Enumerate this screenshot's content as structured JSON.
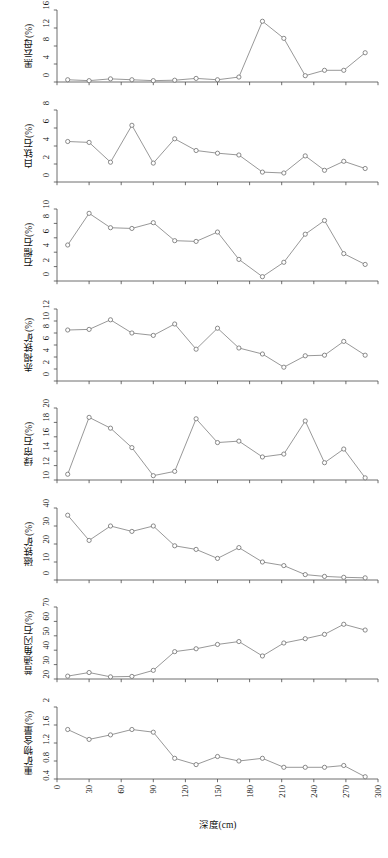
{
  "figure": {
    "xlabel": "深度(cm)",
    "x_ticks": [
      0,
      30,
      60,
      90,
      120,
      150,
      180,
      210,
      240,
      270,
      300
    ],
    "xlim": [
      0,
      300
    ],
    "marker": "open-circle",
    "line_color": "#7d7d7d",
    "marker_color": "#6f6f6f",
    "axis_color": "#4a4a4a",
    "background": "#ffffff"
  },
  "chart_data": [
    {
      "type": "line",
      "title": "",
      "ylabel": "黑云母(%)",
      "xlabel": "深度(cm)",
      "ylim": [
        0,
        16
      ],
      "yticks": [
        0,
        4,
        8,
        12,
        16
      ],
      "xlim": [
        0,
        300
      ],
      "grid": false,
      "legend": "none",
      "x": [
        10,
        30,
        50,
        70,
        90,
        110,
        130,
        150,
        170,
        192,
        212,
        232,
        250,
        268,
        288
      ],
      "values": [
        0.5,
        0.3,
        0.7,
        0.5,
        0.3,
        0.4,
        0.8,
        0.5,
        1.1,
        13.5,
        9.7,
        1.4,
        2.6,
        2.6,
        6.5
      ]
    },
    {
      "type": "line",
      "title": "",
      "ylabel": "白钛石(%)",
      "xlabel": "深度(cm)",
      "ylim": [
        0,
        8
      ],
      "yticks": [
        0,
        2,
        4,
        6,
        8
      ],
      "xlim": [
        0,
        300
      ],
      "grid": false,
      "legend": "none",
      "x": [
        10,
        30,
        50,
        70,
        90,
        110,
        130,
        150,
        170,
        192,
        212,
        232,
        250,
        268,
        288
      ],
      "values": [
        4.5,
        4.4,
        2.2,
        6.3,
        2.1,
        4.8,
        3.5,
        3.2,
        3.0,
        1.1,
        1.0,
        2.9,
        1.3,
        2.3,
        1.5
      ]
    },
    {
      "type": "line",
      "title": "",
      "ylabel": "石榴石(%)",
      "xlabel": "深度(cm)",
      "ylim": [
        0,
        10
      ],
      "yticks": [
        0,
        2,
        4,
        6,
        8,
        10
      ],
      "xlim": [
        0,
        300
      ],
      "grid": false,
      "legend": "none",
      "x": [
        10,
        30,
        50,
        70,
        90,
        110,
        130,
        150,
        170,
        192,
        212,
        232,
        250,
        268,
        288
      ],
      "values": [
        5.0,
        9.4,
        7.4,
        7.3,
        8.1,
        5.6,
        5.5,
        6.8,
        3.0,
        0.6,
        2.6,
        6.5,
        8.4,
        3.8,
        2.3
      ]
    },
    {
      "type": "line",
      "title": "",
      "ylabel": "赤褐铁矿(%)",
      "xlabel": "深度(cm)",
      "ylim": [
        0,
        12
      ],
      "yticks": [
        0,
        2,
        4,
        6,
        8,
        10,
        12
      ],
      "xlim": [
        0,
        300
      ],
      "grid": false,
      "legend": "none",
      "x": [
        10,
        30,
        50,
        70,
        90,
        110,
        130,
        150,
        170,
        192,
        212,
        232,
        250,
        268,
        288
      ],
      "values": [
        8.5,
        8.6,
        10.2,
        8.0,
        7.6,
        9.5,
        5.3,
        8.8,
        5.5,
        4.5,
        2.3,
        4.2,
        4.3,
        6.6,
        4.3
      ]
    },
    {
      "type": "line",
      "title": "",
      "ylabel": "绿帘石(%)",
      "xlabel": "深度(cm)",
      "ylim": [
        10,
        20
      ],
      "yticks": [
        10,
        12,
        14,
        16,
        18,
        20
      ],
      "xlim": [
        0,
        300
      ],
      "grid": false,
      "legend": "none",
      "x": [
        10,
        30,
        50,
        70,
        90,
        110,
        130,
        150,
        170,
        192,
        212,
        232,
        250,
        268,
        288
      ],
      "values": [
        10.8,
        18.7,
        17.2,
        14.5,
        10.6,
        11.2,
        18.5,
        15.2,
        15.4,
        13.2,
        13.6,
        18.2,
        12.4,
        14.3,
        10.3
      ]
    },
    {
      "type": "line",
      "title": "",
      "ylabel": "磁铁矿(%)",
      "xlabel": "深度(cm)",
      "ylim": [
        0,
        40
      ],
      "yticks": [
        0,
        10,
        20,
        30,
        40
      ],
      "xlim": [
        0,
        300
      ],
      "grid": false,
      "legend": "none",
      "x": [
        10,
        30,
        50,
        70,
        90,
        110,
        130,
        150,
        170,
        192,
        212,
        232,
        250,
        268,
        288
      ],
      "values": [
        36.0,
        22.0,
        30.0,
        27.0,
        30.0,
        19.0,
        17.0,
        12.0,
        18.0,
        10.0,
        8.0,
        3.0,
        2.0,
        1.5,
        1.2
      ]
    },
    {
      "type": "line",
      "title": "",
      "ylabel": "普通角闪石(%)",
      "xlabel": "深度(cm)",
      "ylim": [
        20,
        70
      ],
      "yticks": [
        20,
        30,
        40,
        50,
        60,
        70
      ],
      "xlim": [
        0,
        300
      ],
      "grid": false,
      "legend": "none",
      "x": [
        10,
        30,
        50,
        70,
        90,
        110,
        130,
        150,
        170,
        192,
        212,
        232,
        250,
        268,
        288
      ],
      "values": [
        22.0,
        24.5,
        21.5,
        21.8,
        26.0,
        39.0,
        41.0,
        44.0,
        46.0,
        36.0,
        45.0,
        48.0,
        51.0,
        58.0,
        54.0
      ]
    },
    {
      "type": "line",
      "title": "",
      "ylabel": "重矿物含量(%)",
      "xlabel": "深度(cm)",
      "ylim": [
        0.4,
        2.0
      ],
      "yticks": [
        0.4,
        0.8,
        1.2,
        1.6,
        2.0
      ],
      "xlim": [
        0,
        300
      ],
      "grid": false,
      "legend": "none",
      "x": [
        10,
        30,
        50,
        70,
        90,
        110,
        130,
        150,
        170,
        192,
        212,
        232,
        250,
        268,
        288
      ],
      "values": [
        1.5,
        1.28,
        1.38,
        1.5,
        1.44,
        0.86,
        0.72,
        0.9,
        0.8,
        0.86,
        0.66,
        0.66,
        0.66,
        0.7,
        0.45
      ]
    }
  ]
}
